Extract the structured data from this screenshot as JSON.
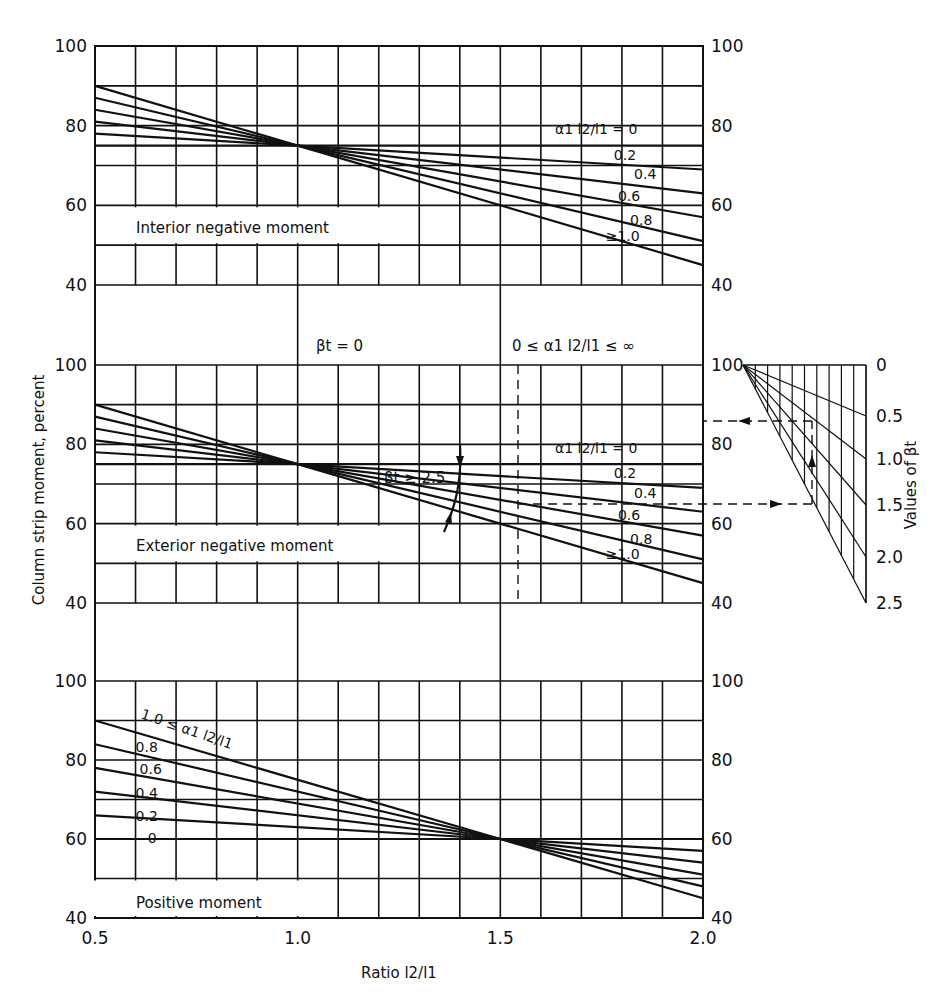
{
  "chart_data": {
    "type": "line",
    "title": "",
    "xlabel": "Ratio l2/l1",
    "ylabel": "Column strip moment, percent",
    "x_ticks": [
      "0.5",
      "1.0",
      "1.5",
      "2.0"
    ],
    "xlim": [
      0.5,
      2.0
    ],
    "grid": true,
    "panels": [
      {
        "name": "Interior negative moment",
        "ylim": [
          40,
          100
        ],
        "y_ticks": [
          "40",
          "60",
          "80",
          "100"
        ],
        "series_label_prefix": "α1 l2/l1 = 0",
        "x": [
          0.5,
          1.0,
          2.0
        ],
        "series": [
          {
            "name": "0",
            "values": [
              75,
              75,
              75
            ]
          },
          {
            "name": "0.2",
            "values": [
              78,
              75,
              69
            ]
          },
          {
            "name": "0.4",
            "values": [
              81,
              75,
              63
            ]
          },
          {
            "name": "0.6",
            "values": [
              84,
              75,
              57
            ]
          },
          {
            "name": "0.8",
            "values": [
              87,
              75,
              51
            ]
          },
          {
            "name": "≥1.0",
            "values": [
              90,
              75,
              45
            ]
          }
        ]
      },
      {
        "name": "Exterior negative moment",
        "ylim": [
          40,
          100
        ],
        "y_ticks": [
          "40",
          "60",
          "80",
          "100"
        ],
        "series_label_prefix": "α1 l2/l1 = 0",
        "annotations": [
          "βt = 0",
          "0 ≤ α1 l2/l1 ≤ ∞",
          "βt ≥ 2.5"
        ],
        "x": [
          0.5,
          1.0,
          2.0
        ],
        "series": [
          {
            "name": "0",
            "values": [
              75,
              75,
              75
            ]
          },
          {
            "name": "0.2",
            "values": [
              78,
              75,
              69
            ]
          },
          {
            "name": "0.4",
            "values": [
              81,
              75,
              63
            ]
          },
          {
            "name": "0.6",
            "values": [
              84,
              75,
              57
            ]
          },
          {
            "name": "0.8",
            "values": [
              87,
              75,
              51
            ]
          },
          {
            "name": "≥1.0",
            "values": [
              90,
              75,
              45
            ]
          }
        ],
        "nomograph": {
          "label": "Values of βt",
          "beta_ticks": [
            "0",
            "0.5",
            "1.0",
            "1.5",
            "2.0",
            "2.5"
          ],
          "example_dashed_path": {
            "start_percent": 65,
            "end_percent": 86,
            "x_ratio": 1.55
          }
        }
      },
      {
        "name": "Positive moment",
        "ylim": [
          40,
          100
        ],
        "y_ticks": [
          "40",
          "60",
          "80",
          "100"
        ],
        "series_label_prefix": "1.0 ≤ α1 l2/l1",
        "x": [
          0.5,
          1.5,
          2.0
        ],
        "series": [
          {
            "name": "0",
            "values": [
              60,
              60,
              60
            ]
          },
          {
            "name": "0.2",
            "values": [
              66,
              60,
              57
            ]
          },
          {
            "name": "0.4",
            "values": [
              72,
              60,
              54
            ]
          },
          {
            "name": "0.6",
            "values": [
              78,
              60,
              51
            ]
          },
          {
            "name": "0.8",
            "values": [
              84,
              60,
              48
            ]
          },
          {
            "name": "1.0",
            "values": [
              90,
              60,
              45
            ]
          }
        ]
      }
    ]
  },
  "labels": {
    "ylabel": "Column strip moment, percent",
    "xlabel_prefix": "Ratio ",
    "interior": "Interior negative moment",
    "exterior": "Exterior negative moment",
    "positive": "Positive moment",
    "beta_zero": "βt = 0",
    "alpha_range": "0 ≤ α1 l2/l1 ≤ ∞",
    "beta_ge": "βt ≥ 2.5",
    "nomo_label": "Values of βt",
    "alpha_eq_zero": "α1 l2/l1 = 0",
    "alpha_pos": "1.0 ≤ α1 l2/l1"
  }
}
